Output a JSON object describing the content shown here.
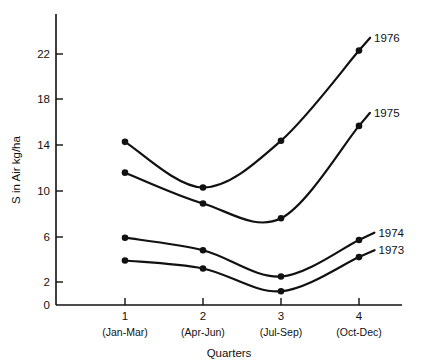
{
  "chart_data": {
    "type": "line",
    "title": "",
    "xlabel": "Quarters",
    "ylabel": "S in Air kg/ha",
    "x": [
      1,
      2,
      3,
      4
    ],
    "categories": [
      "1",
      "2",
      "3",
      "4"
    ],
    "category_sublabels": [
      "(Jan-Mar)",
      "(Apr-Jun)",
      "(Jul-Sep)",
      "(Oct-Dec)"
    ],
    "xlim": [
      0.55,
      4.35
    ],
    "ylim": [
      0,
      24
    ],
    "xticks": [
      "1",
      "2",
      "3",
      "4"
    ],
    "yticks": [
      "0",
      "2",
      "6",
      "10",
      "14",
      "18",
      "22"
    ],
    "ytick_values": [
      0,
      2,
      6,
      10,
      14,
      18,
      22
    ],
    "grid": false,
    "legend": "inline-right-of-last-point",
    "marker": "filled-circle",
    "line_color": "#111111",
    "series": [
      {
        "name": "1973",
        "values": [
          3.9,
          3.2,
          1.2,
          4.2
        ]
      },
      {
        "name": "1974",
        "values": [
          5.9,
          4.8,
          2.5,
          5.7
        ]
      },
      {
        "name": "1975",
        "values": [
          11.6,
          8.9,
          7.6,
          15.7
        ]
      },
      {
        "name": "1976",
        "values": [
          14.3,
          10.3,
          14.4,
          22.3
        ]
      }
    ]
  },
  "axes": {
    "y_axis_title": "S in Air kg/ha",
    "x_axis_title": "Quarters"
  }
}
